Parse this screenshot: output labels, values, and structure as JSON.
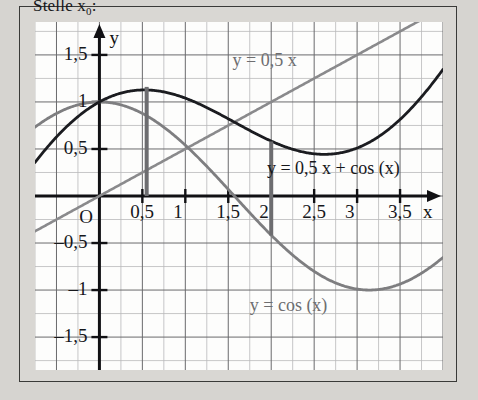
{
  "heading": {
    "text": "Stelle x",
    "subscript": "0",
    "suffix": ":"
  },
  "axes": {
    "x_axis_name": "x",
    "y_axis_name": "y",
    "origin_label": "O"
  },
  "colors": {
    "grid_minor": "#b9b9ba",
    "grid_major": "#6a6a6c",
    "axis": "#111114",
    "curve_sum": "#1b1c20",
    "curve_cos": "#7e7e80",
    "curve_line": "#8a8a8c",
    "marker": "#6d6d70",
    "paper": "#fdfdfc",
    "page": "#d9d7d3",
    "frame": "#3a3a38",
    "text_dark": "#16171b",
    "text_gray": "#6e6e70"
  },
  "chart_data": {
    "type": "line",
    "title": "",
    "xlabel": "x",
    "ylabel": "y",
    "xlim": [
      -0.75,
      4.0
    ],
    "ylim": [
      -1.85,
      1.85
    ],
    "grid": true,
    "grid_step_minor": 0.25,
    "grid_step_major": 0.5,
    "legend": "inline-annotations",
    "xticks": [
      "0,5",
      "1",
      "1,5",
      "2",
      "2,5",
      "3",
      "3,5"
    ],
    "xtick_values": [
      0.5,
      1,
      1.5,
      2,
      2.5,
      3,
      3.5
    ],
    "yticks": [
      "1,5",
      "1",
      "0,5",
      "-0,5",
      "-1",
      "-1,5"
    ],
    "ytick_values": [
      1.5,
      1.0,
      0.5,
      -0.5,
      -1.0,
      -1.5
    ],
    "series": [
      {
        "name": "y = 0,5 x",
        "label": "y = 0,5 x",
        "kind": "line",
        "color": "#8a8a8c",
        "width": 2.6,
        "formula": "0.5*x",
        "label_x": 1.55,
        "label_y": 1.42
      },
      {
        "name": "y = cos (x)",
        "label": "y = cos (x)",
        "kind": "curve",
        "color": "#7e7e80",
        "width": 2.8,
        "formula": "cos(x)",
        "label_x": 1.75,
        "label_y": -1.18
      },
      {
        "name": "y = 0,5 x + cos (x)",
        "label": "y = 0,5 x + cos (x)",
        "kind": "curve",
        "color": "#1b1c20",
        "width": 2.8,
        "formula": "0.5*x + cos(x)",
        "label_x": 1.95,
        "label_y": 0.28
      }
    ],
    "markers": [
      {
        "name": "vertical-marker-near-0,5",
        "x": 0.55,
        "y_from": 0.0,
        "y_to": 1.16,
        "color": "#6d6d70",
        "width": 4
      },
      {
        "name": "vertical-marker-near-2",
        "x": 2.0,
        "y_from": -0.42,
        "y_to": 0.58,
        "color": "#6d6d70",
        "width": 4
      }
    ],
    "annotations": [
      {
        "name": "origin",
        "text": "O",
        "x": -0.13,
        "y": -0.16
      }
    ]
  }
}
